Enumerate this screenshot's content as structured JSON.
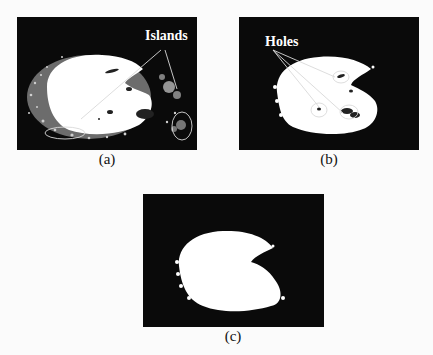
{
  "figure": {
    "panels": [
      {
        "id": "a",
        "label": "(a)",
        "annotation": "Islands",
        "description": "Binary segmented lesion with scattered noise islands"
      },
      {
        "id": "b",
        "label": "(b)",
        "annotation": "Holes",
        "description": "Segmented lesion with small holes circled"
      },
      {
        "id": "c",
        "label": "(c)",
        "annotation": "",
        "description": "Cleaned segmentation after removing islands and filling holes"
      }
    ],
    "caption_fragment": ""
  },
  "colors": {
    "panel_background": "#0a0a0a",
    "foreground_region": "#ffffff",
    "annotation_line": "#d9d9d9",
    "page_background": "#fbfbfb"
  }
}
